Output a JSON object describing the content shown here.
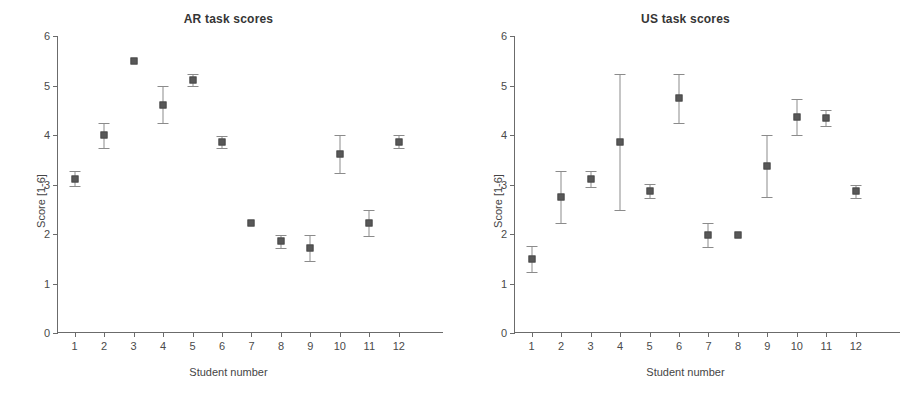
{
  "figure": {
    "width": 915,
    "height": 401,
    "background": "#ffffff",
    "marker_color": "#585858",
    "errorbar_color": "#8b8b8b",
    "axis_color": "#6b6b6b"
  },
  "panels": [
    {
      "id": "ar",
      "title": "AR task scores",
      "xlabel": "Student number",
      "ylabel": "Score [1-6]"
    },
    {
      "id": "us",
      "title": "US task scores",
      "xlabel": "Student number",
      "ylabel": "Score [1-6]"
    }
  ],
  "axes": {
    "y_ticks": [
      "0",
      "1",
      "2",
      "3",
      "4",
      "5",
      "6"
    ],
    "x_ticks": [
      "1",
      "2",
      "3",
      "4",
      "5",
      "6",
      "7",
      "8",
      "9",
      "10",
      "11",
      "12"
    ]
  },
  "chart_data": [
    {
      "type": "scatter",
      "title": "AR task scores",
      "xlabel": "Student number",
      "ylabel": "Score [1-6]",
      "xlim": [
        0.4,
        13.5
      ],
      "ylim": [
        0,
        6
      ],
      "grid": false,
      "legend": null,
      "x": [
        1,
        2,
        3,
        4,
        5,
        6,
        7,
        8,
        9,
        10,
        11,
        12
      ],
      "xtick_labels": [
        "1",
        "2",
        "3",
        "4",
        "5",
        "6",
        "7",
        "8",
        "9",
        "10",
        "11",
        "12"
      ],
      "ytick_labels": [
        "0",
        "1",
        "2",
        "3",
        "4",
        "5",
        "6"
      ],
      "values": [
        3.12,
        3.99,
        5.5,
        4.61,
        5.11,
        3.86,
        2.22,
        1.85,
        1.72,
        3.61,
        2.22,
        3.86
      ],
      "err_low": [
        0.16,
        0.25,
        0.0,
        0.37,
        0.12,
        0.12,
        0.0,
        0.13,
        0.26,
        0.38,
        0.26,
        0.13
      ],
      "err_high": [
        0.16,
        0.25,
        0.0,
        0.37,
        0.12,
        0.12,
        0.0,
        0.13,
        0.26,
        0.38,
        0.26,
        0.13
      ]
    },
    {
      "type": "scatter",
      "title": "US task scores",
      "xlabel": "Student number",
      "ylabel": "Score [1-6]",
      "xlim": [
        0.4,
        13.5
      ],
      "ylim": [
        0,
        6
      ],
      "grid": false,
      "legend": null,
      "x": [
        1,
        2,
        3,
        4,
        5,
        6,
        7,
        8,
        9,
        10,
        11,
        12
      ],
      "xtick_labels": [
        "1",
        "2",
        "3",
        "4",
        "5",
        "6",
        "7",
        "8",
        "9",
        "10",
        "11",
        "12"
      ],
      "ytick_labels": [
        "0",
        "1",
        "2",
        "3",
        "4",
        "5",
        "6"
      ],
      "values": [
        1.5,
        2.75,
        3.11,
        3.86,
        2.87,
        4.74,
        1.98,
        1.97,
        3.37,
        4.36,
        4.34,
        2.86
      ],
      "err_low": [
        0.26,
        0.53,
        0.16,
        1.38,
        0.14,
        0.49,
        0.25,
        0.0,
        0.62,
        0.37,
        0.16,
        0.14
      ],
      "err_high": [
        0.26,
        0.53,
        0.16,
        1.38,
        0.14,
        0.49,
        0.25,
        0.0,
        0.62,
        0.37,
        0.16,
        0.14
      ]
    }
  ]
}
